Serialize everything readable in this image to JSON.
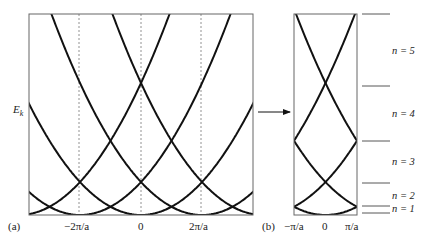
{
  "panel_a": {
    "tag": "(a)",
    "ylabel": "E",
    "ylabel_sub": "k",
    "xticks": [
      "−2π/a",
      "0",
      "2π/a"
    ]
  },
  "panel_b": {
    "tag": "(b)",
    "xticks": [
      "−π/a",
      "0",
      "π/a"
    ]
  },
  "bands": [
    "n = 5",
    "n = 4",
    "n = 3",
    "n = 2",
    "n = 1"
  ],
  "colors": {
    "curve": "#111111",
    "frame": "#666666",
    "dashed": "#777777"
  },
  "chart_data": [
    {
      "type": "line",
      "title": "(a) Extended zone scheme: free-electron parabolas E_k = ħ²(k+G)²/2m repeated at reciprocal lattice vectors",
      "xlabel": "k",
      "ylabel": "E_k",
      "xticks": [
        "−2π/a",
        "0",
        "2π/a"
      ],
      "series": [
        {
          "name": "G = −4π/a",
          "center": "−4π/a"
        },
        {
          "name": "G = −2π/a",
          "center": "−2π/a"
        },
        {
          "name": "G = 0",
          "center": "0"
        },
        {
          "name": "G = 2π/a",
          "center": "2π/a"
        },
        {
          "name": "G = 4π/a",
          "center": "4π/a"
        }
      ],
      "dashed_verticals": [
        "−2π/a",
        "0",
        "2π/a"
      ]
    },
    {
      "type": "line",
      "title": "(b) Reduced zone scheme: bands folded into first Brillouin zone",
      "xticks": [
        "−π/a",
        "0",
        "π/a"
      ],
      "band_labels": [
        "n = 1",
        "n = 2",
        "n = 3",
        "n = 4",
        "n = 5"
      ]
    }
  ]
}
